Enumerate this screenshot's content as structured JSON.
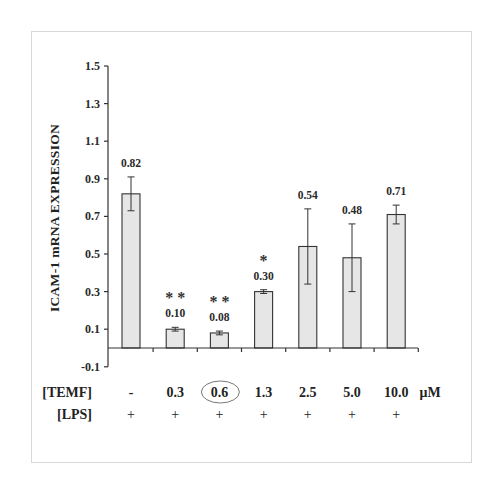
{
  "chart_data": {
    "type": "bar",
    "title": "",
    "xlabel": "",
    "ylabel": "ICAM-1 mRNA EXPRESSION",
    "ylim": [
      -0.1,
      1.5
    ],
    "yticks": [
      -0.1,
      0.1,
      0.3,
      0.5,
      0.7,
      0.9,
      1.1,
      1.3,
      1.5
    ],
    "ytick_labels": [
      "-0.1",
      "0.1",
      "0.3",
      "0.5",
      "0.7",
      "0.9",
      "1.1",
      "1.3",
      "1.5"
    ],
    "grid": false,
    "legend": null,
    "categories": [
      "-",
      "0.3",
      "0.6",
      "1.3",
      "2.5",
      "5.0",
      "10.0"
    ],
    "values": [
      0.82,
      0.1,
      0.08,
      0.3,
      0.54,
      0.48,
      0.71
    ],
    "value_labels": [
      "0.82",
      "0.10",
      "0.08",
      "0.30",
      "0.54",
      "0.48",
      "0.71"
    ],
    "error_bars": [
      0.09,
      0.01,
      0.01,
      0.01,
      0.2,
      0.18,
      0.05
    ],
    "significance": [
      "",
      "**",
      "**",
      "*",
      "",
      "",
      ""
    ],
    "bar_color": "#e6e6e6",
    "bar_edge_color": "#333333",
    "x_rows": [
      {
        "label": "[TEMF]",
        "values": [
          "-",
          "0.3",
          "0.6",
          "1.3",
          "2.5",
          "5.0",
          "10.0"
        ],
        "unit": "μM"
      },
      {
        "label": "[LPS]",
        "values": [
          "+",
          "+",
          "+",
          "+",
          "+",
          "+",
          "+"
        ]
      }
    ],
    "annotations": [
      {
        "type": "ellipse",
        "around": "0.6",
        "row": "[TEMF]"
      }
    ]
  }
}
